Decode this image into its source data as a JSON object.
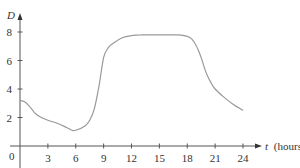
{
  "chart_data": {
    "type": "line",
    "title": "",
    "xlabel": "t (hours)",
    "xlabel_var": "t",
    "xlabel_unit": "(hours)",
    "ylabel": "D",
    "xlim": [
      0,
      25
    ],
    "ylim": [
      0,
      8.8
    ],
    "xticks": [
      3,
      6,
      9,
      12,
      15,
      18,
      21,
      24
    ],
    "xtick_labels": [
      "3",
      "6",
      "9",
      "12",
      "15",
      "18",
      "21",
      "24"
    ],
    "yticks": [
      2,
      4,
      6,
      8
    ],
    "ytick_labels": [
      "2",
      "4",
      "6",
      "8"
    ],
    "origin_label": "0",
    "grid": false,
    "legend": null,
    "series": [
      {
        "name": "D(t)",
        "color": "#999999",
        "x": [
          0,
          0.5,
          1,
          1.5,
          2,
          3,
          4,
          5,
          5.6,
          6,
          7,
          7.5,
          8,
          8.5,
          9,
          9.5,
          10,
          11,
          12,
          13,
          15,
          17,
          18,
          18.5,
          19,
          19.5,
          20,
          20.5,
          21,
          22,
          23,
          24
        ],
        "values": [
          3.2,
          3.1,
          2.8,
          2.4,
          2.1,
          1.8,
          1.6,
          1.3,
          1.1,
          1.1,
          1.4,
          1.8,
          2.6,
          4.2,
          6.2,
          6.9,
          7.2,
          7.6,
          7.75,
          7.8,
          7.8,
          7.8,
          7.7,
          7.5,
          7.0,
          6.2,
          5.2,
          4.5,
          4.0,
          3.4,
          2.9,
          2.5
        ]
      }
    ]
  },
  "colors": {
    "axis": "#555555",
    "curve": "#999999",
    "text": "#333333"
  }
}
